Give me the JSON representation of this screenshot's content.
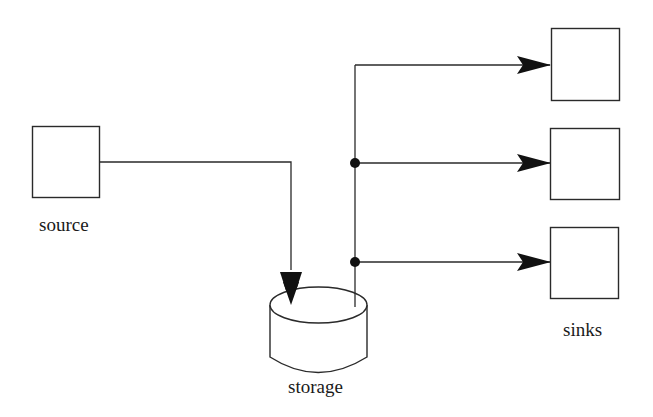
{
  "diagram": {
    "nodes": [
      {
        "id": "source",
        "label": "source",
        "shape": "box"
      },
      {
        "id": "storage",
        "label": "storage",
        "shape": "cylinder"
      },
      {
        "id": "sink1",
        "label": "",
        "shape": "box"
      },
      {
        "id": "sink2",
        "label": "",
        "shape": "box"
      },
      {
        "id": "sink3",
        "label": "",
        "shape": "box"
      }
    ],
    "group_labels": {
      "sinks": "sinks"
    },
    "edges": [
      {
        "from": "source",
        "to": "storage",
        "arrow": "filled"
      },
      {
        "from": "storage",
        "to": "sink1",
        "arrow": "filled"
      },
      {
        "from": "storage",
        "to": "sink2",
        "arrow": "filled",
        "junction": "dot"
      },
      {
        "from": "storage",
        "to": "sink3",
        "arrow": "filled",
        "junction": "dot"
      }
    ],
    "colors": {
      "stroke": "#2a2a2a",
      "background": "#ffffff"
    }
  }
}
